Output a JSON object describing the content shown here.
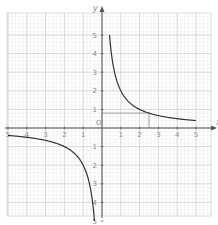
{
  "chart_data": {
    "type": "line",
    "title": "",
    "xlabel": "x",
    "ylabel": "y",
    "xlim": [
      -5,
      5
    ],
    "ylim": [
      -5,
      5
    ],
    "grid": true,
    "grid_minor_step": 0.2,
    "grid_major_step": 1,
    "x_ticks": [
      -5,
      -4,
      -3,
      -2,
      -1,
      1,
      2,
      3,
      4,
      5
    ],
    "x_tick_labels": [
      "5",
      "4",
      "3",
      "2",
      "1",
      "1",
      "2",
      "3",
      "4",
      "5"
    ],
    "y_ticks": [
      5,
      4,
      3,
      2,
      1,
      -1,
      -2,
      -3,
      -4,
      -5
    ],
    "y_tick_labels": [
      "5",
      "4",
      "3",
      "2",
      "1",
      "1",
      "2",
      "3",
      "4",
      "5"
    ],
    "origin_label": "O",
    "series": [
      {
        "name": "y = 2/x (first quadrant branch)",
        "function": "2/x",
        "x": [
          0.4,
          0.5,
          0.6,
          0.8,
          1.0,
          1.25,
          1.5,
          2.0,
          2.5,
          3.0,
          3.5,
          4.0,
          4.5,
          5.0
        ],
        "y": [
          5.0,
          4.0,
          3.33,
          2.5,
          2.0,
          1.6,
          1.33,
          1.0,
          0.8,
          0.67,
          0.57,
          0.5,
          0.44,
          0.4
        ]
      },
      {
        "name": "y = 2/x (third quadrant branch)",
        "function": "2/x",
        "x": [
          -5.0,
          -4.5,
          -4.0,
          -3.5,
          -3.0,
          -2.5,
          -2.0,
          -1.5,
          -1.25,
          -1.0,
          -0.8,
          -0.6,
          -0.5,
          -0.4
        ],
        "y": [
          -0.4,
          -0.44,
          -0.5,
          -0.57,
          -0.67,
          -0.8,
          -1.0,
          -1.33,
          -1.6,
          -2.0,
          -2.5,
          -3.33,
          -4.0,
          -5.0
        ]
      }
    ],
    "annotations": [
      {
        "type": "horizontal-guide",
        "y": 0.8,
        "x_from": 0,
        "x_to": 2.5
      },
      {
        "type": "vertical-guide",
        "x": 2.5,
        "y_from": 0,
        "y_to": 0.8
      }
    ]
  },
  "colors": {
    "curve": "#333333",
    "axis": "#555555",
    "grid_major": "#c8c8c8",
    "grid_minor": "#ebebeb",
    "guide": "#888888",
    "label": "#8a8a8a"
  },
  "layout": {
    "origin_px": [
      102,
      128
    ],
    "unit_px_x": 18.8,
    "unit_px_y": 18.6,
    "grid_left": 7,
    "grid_right": 211,
    "grid_top": 13,
    "grid_bottom": 216
  }
}
